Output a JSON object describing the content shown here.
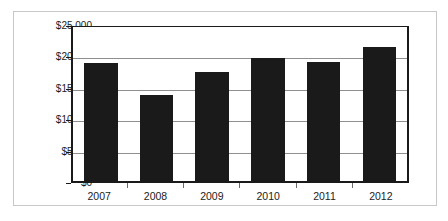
{
  "chart_data": {
    "type": "bar",
    "title": "",
    "subtitle": "",
    "xlabel": "",
    "ylabel": "",
    "categories": [
      "2007",
      "2008",
      "2009",
      "2010",
      "2011",
      "2012"
    ],
    "values": [
      19100,
      13900,
      17700,
      20000,
      19400,
      21800
    ],
    "series": [
      {
        "name": "",
        "values": [
          19100,
          13900,
          17700,
          20000,
          19400,
          21800
        ]
      }
    ],
    "ylim": [
      0,
      25000
    ],
    "ytick_values": [
      0,
      5000,
      10000,
      15000,
      20000,
      25000
    ],
    "ytick_labels": [
      "$0",
      "$5,000",
      "$10,000",
      "$15,000",
      "$20,000",
      "$25,000"
    ],
    "xtick_labels": [
      "2007",
      "2008",
      "2009",
      "2010",
      "2011",
      "2012"
    ],
    "grid": true,
    "grid_axis": "y",
    "legend": false,
    "legend_position": "none",
    "annotations": [],
    "colors": {
      "bar": "#1a1a1a",
      "gridline": "#8f8f8f",
      "axis": "#1a1a1a",
      "plot_background": "#ffffff",
      "figure_border": "#c8c8c8",
      "tick_label": "#1c1c1c"
    }
  }
}
